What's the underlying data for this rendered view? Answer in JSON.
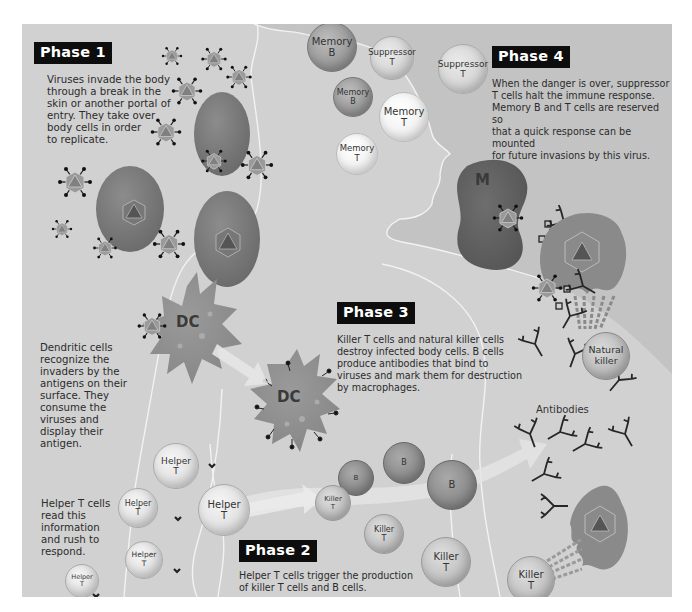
{
  "diagram": {
    "phases": [
      {
        "id": "phase1",
        "label": "Phase 1",
        "text_lines": [
          "Viruses invade the body",
          "through a break in the",
          "skin or another portal of",
          "entry. They take over",
          "body cells in order",
          "to replicate."
        ]
      },
      {
        "id": "phase2",
        "label": "Phase 2",
        "text_lines": [
          "Helper T cells trigger the production",
          "of killer T cells and B cells."
        ]
      },
      {
        "id": "phase3",
        "label": "Phase 3",
        "text_lines": [
          "Killer T cells and natural killer cells",
          "destroy infected body cells. B cells",
          "produce antibodies that bind to",
          "viruses and mark them for destruction",
          "by macrophages."
        ]
      },
      {
        "id": "phase4",
        "label": "Phase 4",
        "text_lines": [
          "When the danger is over, suppressor",
          "T cells halt the immune response.",
          "Memory B and T cells are reserved so",
          "that a quick response can be mounted",
          "for future invasions by this virus."
        ]
      }
    ],
    "side_notes": {
      "dendritic": [
        "Dendritic cells",
        "recognize the",
        "invaders by the",
        "antigens on their",
        "surface. They",
        "consume the",
        "viruses and",
        "display their",
        "antigen."
      ],
      "helper": [
        "Helper T cells",
        "read this",
        "information",
        "and rush to",
        "respond."
      ]
    },
    "cells": {
      "memory_b_1": [
        "Memory",
        "B"
      ],
      "memory_b_2": [
        "Memory",
        "B"
      ],
      "suppressor_t_1": [
        "Suppressor",
        "T"
      ],
      "suppressor_t_2": [
        "Suppressor",
        "T"
      ],
      "memory_t_1": [
        "Memory",
        "T"
      ],
      "memory_t_2": [
        "Memory",
        "T"
      ],
      "helper_t_1": [
        "Helper",
        "T"
      ],
      "helper_t_2": [
        "Helper",
        "T"
      ],
      "helper_t_3": [
        "Helper",
        "T"
      ],
      "helper_t_4": [
        "Helper",
        "T"
      ],
      "helper_t_5": [
        "Helper",
        "T"
      ],
      "killer_t_1": [
        "Killer",
        "T"
      ],
      "killer_t_2": [
        "Killer",
        "T"
      ],
      "killer_t_3": [
        "Killer",
        "T"
      ],
      "killer_t_4": [
        "Killer",
        "T"
      ],
      "b_1": [
        "B"
      ],
      "b_2": [
        "B"
      ],
      "b_3": [
        "B"
      ],
      "natural_killer": [
        "Natural",
        "killer"
      ],
      "dc_1": "DC",
      "dc_2": "DC",
      "macrophage": "M"
    },
    "labels": {
      "antibodies": "Antibodies"
    },
    "colors": {
      "panel_bg": "#c9c9c9",
      "body_silhouette": "#d3d3d3",
      "phase_label_bg": "#0d0d0d",
      "phase_label_text": "#ffffff",
      "outline": "#f4f4f4"
    }
  }
}
